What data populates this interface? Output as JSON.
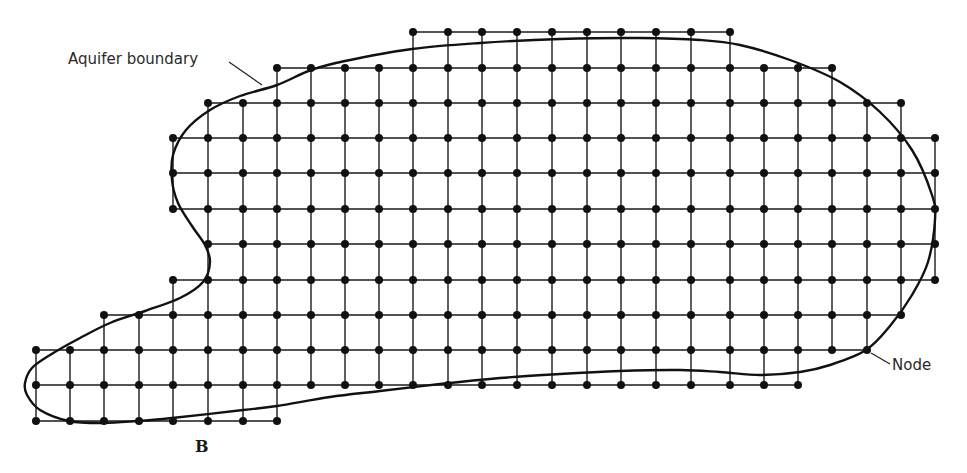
{
  "figure": {
    "labels": {
      "aquifer_boundary": "Aquifer boundary",
      "node": "Node",
      "panel": "B"
    },
    "colors": {
      "ink": "#111111",
      "background": "#ffffff"
    },
    "grid": {
      "columns_x": [
        36,
        70,
        104,
        139,
        173,
        208,
        243,
        277,
        311,
        345,
        379,
        413,
        448,
        482,
        517,
        552,
        587,
        621,
        656,
        691,
        730,
        764,
        798,
        832,
        867,
        901,
        935
      ],
      "rows": [
        {
          "y": 32,
          "from_col": 11,
          "to_col": 20
        },
        {
          "y": 68,
          "from_col": 7,
          "to_col": 23
        },
        {
          "y": 103,
          "from_col": 5,
          "to_col": 25
        },
        {
          "y": 138,
          "from_col": 4,
          "to_col": 26
        },
        {
          "y": 173,
          "from_col": 4,
          "to_col": 26
        },
        {
          "y": 209,
          "from_col": 4,
          "to_col": 26
        },
        {
          "y": 244,
          "from_col": 5,
          "to_col": 26
        },
        {
          "y": 280,
          "from_col": 4,
          "to_col": 26
        },
        {
          "y": 315,
          "from_col": 2,
          "to_col": 25
        },
        {
          "y": 350,
          "from_col": 0,
          "to_col": 24
        },
        {
          "y": 385,
          "from_col": 0,
          "to_col": 22
        },
        {
          "y": 421,
          "from_col": 0,
          "to_col": 7
        }
      ]
    },
    "boundary_points": [
      [
        277,
        85
      ],
      [
        311,
        70
      ],
      [
        345,
        61
      ],
      [
        412,
        49
      ],
      [
        480,
        43
      ],
      [
        560,
        39
      ],
      [
        640,
        38
      ],
      [
        700,
        40
      ],
      [
        740,
        45
      ],
      [
        790,
        60
      ],
      [
        840,
        82
      ],
      [
        880,
        112
      ],
      [
        912,
        150
      ],
      [
        932,
        195
      ],
      [
        935,
        220
      ],
      [
        928,
        262
      ],
      [
        912,
        295
      ],
      [
        890,
        326
      ],
      [
        866,
        350
      ],
      [
        830,
        365
      ],
      [
        800,
        372
      ],
      [
        760,
        375
      ],
      [
        720,
        372
      ],
      [
        680,
        370
      ],
      [
        620,
        371
      ],
      [
        560,
        374
      ],
      [
        500,
        378
      ],
      [
        440,
        384
      ],
      [
        380,
        391
      ],
      [
        330,
        397
      ],
      [
        277,
        406
      ],
      [
        243,
        410
      ],
      [
        172,
        418
      ],
      [
        138,
        421
      ],
      [
        103,
        423
      ],
      [
        69,
        421
      ],
      [
        40,
        410
      ],
      [
        27,
        395
      ],
      [
        25,
        383
      ],
      [
        32,
        368
      ],
      [
        50,
        355
      ],
      [
        80,
        338
      ],
      [
        110,
        323
      ],
      [
        145,
        311
      ],
      [
        180,
        298
      ],
      [
        203,
        282
      ],
      [
        210,
        262
      ],
      [
        205,
        245
      ],
      [
        192,
        226
      ],
      [
        178,
        203
      ],
      [
        172,
        180
      ],
      [
        173,
        155
      ],
      [
        186,
        130
      ],
      [
        210,
        110
      ],
      [
        240,
        96
      ],
      [
        277,
        85
      ]
    ],
    "annotations": {
      "aquifer_boundary_label": {
        "x": 68,
        "y": 50
      },
      "aquifer_boundary_leader": [
        [
          229,
          62
        ],
        [
          262,
          85
        ]
      ],
      "node_label": {
        "x": 892,
        "y": 356
      },
      "node_leader": [
        [
          871,
          353
        ],
        [
          890,
          364
        ]
      ],
      "panel_label": {
        "x": 195,
        "y": 437
      }
    }
  }
}
